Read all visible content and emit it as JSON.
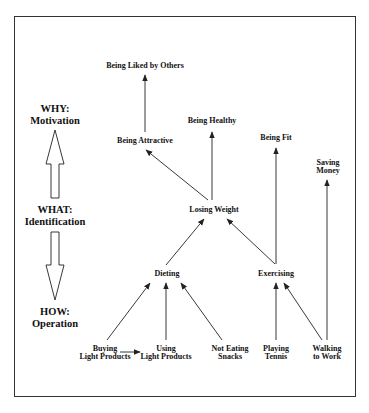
{
  "diagram": {
    "type": "goal-hierarchy",
    "levels": [
      {
        "id": "why",
        "title": "WHY:",
        "subtitle": "Motivation"
      },
      {
        "id": "what",
        "title": "WHAT:",
        "subtitle": "Identification"
      },
      {
        "id": "how",
        "title": "HOW:",
        "subtitle": "Operation"
      }
    ],
    "level_arrows": [
      {
        "from": "what",
        "to": "why",
        "direction": "up"
      },
      {
        "from": "what",
        "to": "how",
        "direction": "down"
      }
    ],
    "nodes": {
      "being_liked": {
        "line1": "Being Liked by Others"
      },
      "being_attractive": {
        "line1": "Being Attractive"
      },
      "being_healthy": {
        "line1": "Being Healthy"
      },
      "being_fit": {
        "line1": "Being Fit"
      },
      "saving_money": {
        "line1": "Saving",
        "line2": "Money"
      },
      "losing_weight": {
        "line1": "Losing Weight"
      },
      "dieting": {
        "line1": "Dieting"
      },
      "exercising": {
        "line1": "Exercising"
      },
      "buying_light": {
        "line1": "Buying",
        "line2": "Light Products"
      },
      "using_light": {
        "line1": "Using",
        "line2": "Light Products"
      },
      "not_eating_snacks": {
        "line1": "Not Eating",
        "line2": "Snacks"
      },
      "playing_tennis": {
        "line1": "Playing",
        "line2": "Tennis"
      },
      "walking_to_work": {
        "line1": "Walking",
        "line2": "to Work"
      }
    },
    "edges": [
      {
        "from": "being_attractive",
        "to": "being_liked"
      },
      {
        "from": "losing_weight",
        "to": "being_attractive"
      },
      {
        "from": "losing_weight",
        "to": "being_healthy"
      },
      {
        "from": "dieting",
        "to": "losing_weight"
      },
      {
        "from": "exercising",
        "to": "losing_weight"
      },
      {
        "from": "exercising",
        "to": "being_fit"
      },
      {
        "from": "walking_to_work",
        "to": "saving_money"
      },
      {
        "from": "buying_light",
        "to": "dieting"
      },
      {
        "from": "buying_light",
        "to": "using_light"
      },
      {
        "from": "using_light",
        "to": "dieting"
      },
      {
        "from": "not_eating_snacks",
        "to": "dieting"
      },
      {
        "from": "playing_tennis",
        "to": "exercising"
      },
      {
        "from": "walking_to_work",
        "to": "exercising"
      }
    ],
    "colors": {
      "line": "#222222",
      "text": "#111111",
      "border": "#333333",
      "background": "#ffffff"
    }
  }
}
